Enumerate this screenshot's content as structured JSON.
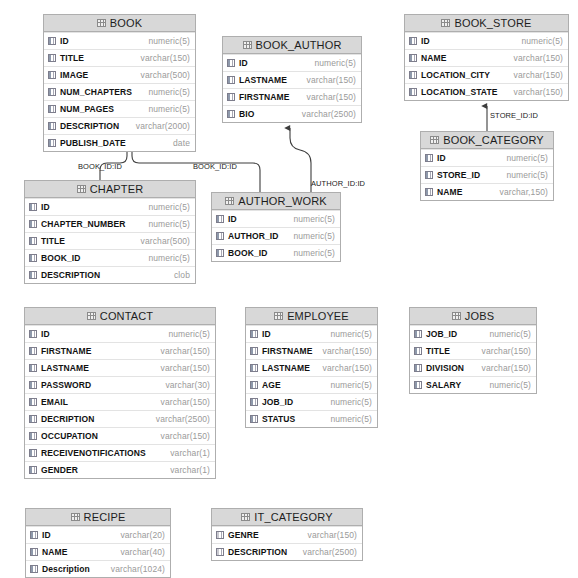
{
  "diagram": {
    "colors": {
      "header_fill": "#d8d8d8",
      "table_border": "#aeaeae",
      "row_divider": "#e3e3e3",
      "column_name": "#111111",
      "column_type": "#9a9a9a",
      "connector": "#4a4a4a",
      "background": "#ffffff"
    },
    "tables": [
      {
        "name": "BOOK",
        "x": 43,
        "y": 14,
        "width": 153,
        "columns": [
          {
            "name": "ID",
            "type": "numeric(5)"
          },
          {
            "name": "TITLE",
            "type": "varchar(150)"
          },
          {
            "name": "IMAGE",
            "type": "varchar(500)"
          },
          {
            "name": "NUM_CHAPTERS",
            "type": "numeric(5)"
          },
          {
            "name": "NUM_PAGES",
            "type": "numeric(5)"
          },
          {
            "name": "DESCRIPTION",
            "type": "varchar(2000)"
          },
          {
            "name": "PUBLISH_DATE",
            "type": "date"
          }
        ]
      },
      {
        "name": "BOOK_AUTHOR",
        "x": 222,
        "y": 36,
        "width": 140,
        "columns": [
          {
            "name": "ID",
            "type": "numeric(5)"
          },
          {
            "name": "LASTNAME",
            "type": "varchar(150)"
          },
          {
            "name": "FIRSTNAME",
            "type": "varchar(150)"
          },
          {
            "name": "BIO",
            "type": "varchar(2500)"
          }
        ]
      },
      {
        "name": "BOOK_STORE",
        "x": 404,
        "y": 14,
        "width": 165,
        "columns": [
          {
            "name": "ID",
            "type": "numeric(5)"
          },
          {
            "name": "NAME",
            "type": "varchar(150)"
          },
          {
            "name": "LOCATION_CITY",
            "type": "varchar(150)"
          },
          {
            "name": "LOCATION_STATE",
            "type": "varchar(150)"
          }
        ]
      },
      {
        "name": "BOOK_CATEGORY",
        "x": 420,
        "y": 131,
        "width": 134,
        "columns": [
          {
            "name": "ID",
            "type": "numeric(5)"
          },
          {
            "name": "STORE_ID",
            "type": "numeric(5)"
          },
          {
            "name": "NAME",
            "type": "varchar,150)"
          }
        ]
      },
      {
        "name": "CHAPTER",
        "x": 24,
        "y": 180,
        "width": 172,
        "columns": [
          {
            "name": "ID",
            "type": "numeric(5)"
          },
          {
            "name": "CHAPTER_NUMBER",
            "type": "numeric(5)"
          },
          {
            "name": "TITLE",
            "type": "varchar(500)"
          },
          {
            "name": "BOOK_ID",
            "type": "numeric(5)"
          },
          {
            "name": "DESCRIPTION",
            "type": "clob"
          }
        ]
      },
      {
        "name": "AUTHOR_WORK",
        "x": 211,
        "y": 192,
        "width": 130,
        "columns": [
          {
            "name": "ID",
            "type": "numeric(5)"
          },
          {
            "name": "AUTHOR_ID",
            "type": "numeric(5)"
          },
          {
            "name": "BOOK_ID",
            "type": "numeric(5)"
          }
        ]
      },
      {
        "name": "CONTACT",
        "x": 24,
        "y": 307,
        "width": 192,
        "columns": [
          {
            "name": "ID",
            "type": "numeric(5)"
          },
          {
            "name": "FIRSTNAME",
            "type": "varchar(150)"
          },
          {
            "name": "LASTNAME",
            "type": "varchar(150)"
          },
          {
            "name": "PASSWORD",
            "type": "varchar(30)"
          },
          {
            "name": "EMAIL",
            "type": "varchar(150)"
          },
          {
            "name": "DECRIPTION",
            "type": "varchar(2500)"
          },
          {
            "name": "OCCUPATION",
            "type": "varchar(150)"
          },
          {
            "name": "RECEIVENOTIFICATIONS",
            "type": "varchar(1)"
          },
          {
            "name": "GENDER",
            "type": "varchar(1)"
          }
        ]
      },
      {
        "name": "EMPLOYEE",
        "x": 245,
        "y": 307,
        "width": 133,
        "columns": [
          {
            "name": "ID",
            "type": "numeric(5)"
          },
          {
            "name": "FIRSTNAME",
            "type": "varchar(150)"
          },
          {
            "name": "LASTNAME",
            "type": "varchar(150)"
          },
          {
            "name": "AGE",
            "type": "numeric(5)"
          },
          {
            "name": "JOB_ID",
            "type": "numeric(5)"
          },
          {
            "name": "STATUS",
            "type": "numeric(5)"
          }
        ]
      },
      {
        "name": "JOBS",
        "x": 409,
        "y": 307,
        "width": 128,
        "columns": [
          {
            "name": "JOB_ID",
            "type": "numeric(5)"
          },
          {
            "name": "TITLE",
            "type": "varchar(150)"
          },
          {
            "name": "DIVISION",
            "type": "varchar(150)"
          },
          {
            "name": "SALARY",
            "type": "numeric(5)"
          }
        ]
      },
      {
        "name": "RECIPE",
        "x": 25,
        "y": 508,
        "width": 146,
        "columns": [
          {
            "name": "ID",
            "type": "varchar(20)"
          },
          {
            "name": "NAME",
            "type": "varchar(40)"
          },
          {
            "name": "Description",
            "type": "varchar(1024)"
          }
        ]
      },
      {
        "name": "IT_CATEGORY",
        "x": 211,
        "y": 508,
        "width": 152,
        "columns": [
          {
            "name": "GENRE",
            "type": "varchar(150)"
          },
          {
            "name": "DESCRIPTION",
            "type": "varchar(2500)"
          }
        ]
      }
    ],
    "relations": [
      {
        "label": "BOOK_ID:ID",
        "from": "CHAPTER",
        "to": "BOOK",
        "label_x": 78,
        "label_y": 163
      },
      {
        "label": "BOOK_ID:ID",
        "from": "AUTHOR_WORK",
        "to": "BOOK",
        "label_x": 193,
        "label_y": 163
      },
      {
        "label": "AUTHOR_ID:ID",
        "from": "AUTHOR_WORK",
        "to": "BOOK_AUTHOR",
        "label_x": 311,
        "label_y": 180
      },
      {
        "label": "STORE_ID:ID",
        "from": "BOOK_CATEGORY",
        "to": "BOOK_STORE",
        "label_x": 490,
        "label_y": 112
      }
    ]
  }
}
